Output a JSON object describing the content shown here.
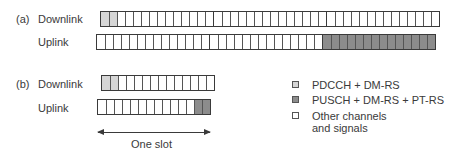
{
  "colors": {
    "pdcch": "#d6d6d6",
    "pusch": "#8c8c8c",
    "other": "#ffffff",
    "border": "#3a3a3a"
  },
  "panel_a": {
    "tag": "(a)",
    "downlink": {
      "label": "Downlink",
      "slots": 3,
      "symbols_per_slot": 14,
      "light_cells": [
        0,
        1
      ],
      "dark_cells": []
    },
    "uplink": {
      "label": "Uplink",
      "slots": 3,
      "symbols_per_slot": 14,
      "light_cells": [],
      "dark_cells": [
        28,
        29,
        30,
        31,
        32,
        33,
        34,
        35,
        36,
        37,
        38,
        39,
        40,
        41
      ]
    }
  },
  "panel_b": {
    "tag": "(b)",
    "downlink": {
      "label": "Downlink",
      "slots": 1,
      "symbols_per_slot": 14,
      "light_cells": [
        0,
        1
      ],
      "dark_cells": []
    },
    "uplink": {
      "label": "Uplink",
      "slots": 1,
      "symbols_per_slot": 14,
      "light_cells": [],
      "dark_cells": [
        12,
        13
      ]
    },
    "span_label": "One slot"
  },
  "legend": {
    "items": [
      {
        "label": "PDCCH + DM-RS",
        "color": "#d6d6d6"
      },
      {
        "label": "PUSCH + DM-RS + PT-RS",
        "color": "#8c8c8c"
      },
      {
        "label_line1": "Other channels",
        "label_line2": "and signals",
        "color": "#ffffff"
      }
    ]
  }
}
